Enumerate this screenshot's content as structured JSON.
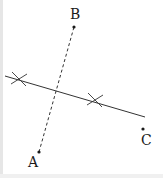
{
  "diagram": {
    "points": [
      {
        "label": "A",
        "x": 39,
        "y": 152,
        "label_x": 28,
        "label_y": 155
      },
      {
        "label": "B",
        "x": 74,
        "y": 27,
        "label_x": 70,
        "label_y": 7
      },
      {
        "label": "C",
        "x": 143,
        "y": 129,
        "label_x": 141,
        "label_y": 133
      }
    ],
    "segment_AB": {
      "style": "dashed",
      "from": "A",
      "to": "B"
    },
    "bisector": {
      "style": "solid",
      "x1": 5,
      "y1": 76,
      "x2": 145,
      "y2": 117
    },
    "arc_marks": [
      {
        "x": 19,
        "y": 79
      },
      {
        "x": 95,
        "y": 100
      }
    ],
    "colors": {
      "ink": "#1a1a1a",
      "line": "#333333"
    }
  }
}
